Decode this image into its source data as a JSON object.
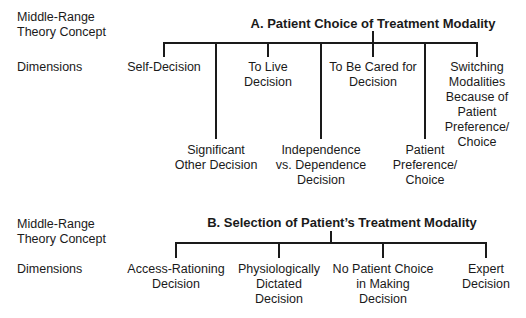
{
  "sections": [
    {
      "id": "A",
      "concept_label": "Middle-Range\nTheory Concept",
      "concept_label_lines": [
        "Middle-Range",
        "Theory Concept"
      ],
      "dimensions_label": "Dimensions",
      "title": "A. Patient Choice of Treatment Modality",
      "dimensions": [
        {
          "lines": [
            "Self-Decision"
          ],
          "level": "upper"
        },
        {
          "lines": [
            "Significant",
            "Other Decision"
          ],
          "level": "lower"
        },
        {
          "lines": [
            "To Live",
            "Decision"
          ],
          "level": "upper"
        },
        {
          "lines": [
            "Independence",
            "vs. Dependence",
            "Decision"
          ],
          "level": "lower"
        },
        {
          "lines": [
            "To Be Cared for",
            "Decision"
          ],
          "level": "upper"
        },
        {
          "lines": [
            "Patient",
            "Preference/",
            "Choice"
          ],
          "level": "lower"
        },
        {
          "lines": [
            "Switching",
            "Modalities",
            "Because of",
            "Patient",
            "Preference/",
            "Choice"
          ],
          "level": "upper"
        }
      ]
    },
    {
      "id": "B",
      "concept_label_lines": [
        "Middle-Range",
        "Theory Concept"
      ],
      "dimensions_label": "Dimensions",
      "title": "B. Selection of Patient’s Treatment Modality",
      "dimensions": [
        {
          "lines": [
            "Access-Rationing",
            "Decision"
          ]
        },
        {
          "lines": [
            "Physiologically",
            "Dictated",
            "Decision"
          ]
        },
        {
          "lines": [
            "No Patient Choice",
            "in Making",
            "Decision"
          ]
        },
        {
          "lines": [
            "Expert",
            "Decision"
          ]
        }
      ]
    }
  ]
}
